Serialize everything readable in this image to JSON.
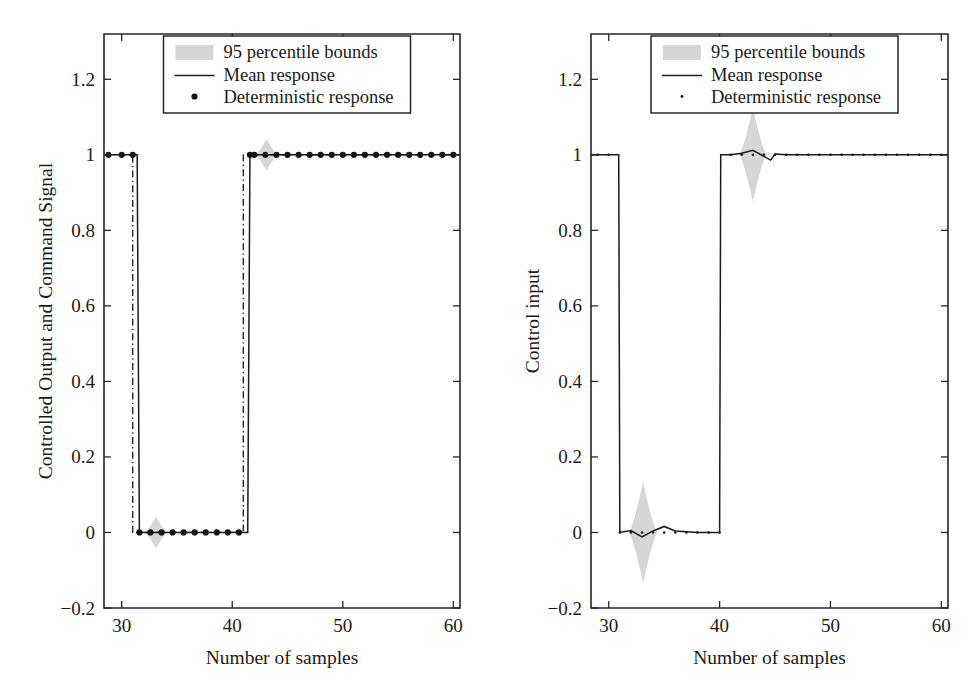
{
  "figure": {
    "background": "#ffffff",
    "band_color": "#d6d6d6",
    "line_color": "#1a1a1a",
    "axis_color": "#262626"
  },
  "chart_data": [
    {
      "id": "left",
      "type": "line",
      "title": "",
      "xlabel": "Number of samples",
      "ylabel": "Controlled Output and Command Signal",
      "xlim": [
        28.4,
        60.6
      ],
      "ylim": [
        -0.2,
        1.32
      ],
      "xticks": [
        30,
        40,
        50,
        60
      ],
      "xtick_labels": [
        "30",
        "40",
        "50",
        "60"
      ],
      "yticks": [
        -0.2,
        0,
        0.2,
        0.4,
        0.6,
        0.8,
        1,
        1.2
      ],
      "ytick_labels": [
        "-0.2",
        "0",
        "0.2",
        "0.4",
        "0.6",
        "0.8",
        "1",
        "1.2"
      ],
      "grid": false,
      "legend_position": "top-center",
      "legend": [
        {
          "marker": "patch",
          "label": "95 percentile bounds"
        },
        {
          "marker": "line",
          "label": "Mean response"
        },
        {
          "marker": "dot",
          "label": "Deterministic response"
        }
      ],
      "series": [
        {
          "name": "Command signal",
          "style": "dash-dot",
          "x": [
            28.4,
            31.0,
            31.0,
            41.0,
            41.0,
            60.6
          ],
          "values": [
            1,
            1,
            0,
            0,
            1,
            1
          ]
        },
        {
          "name": "Mean response",
          "style": "solid",
          "x": [
            28.4,
            31.4,
            31.6,
            41.4,
            41.6,
            60.6
          ],
          "values": [
            1,
            1,
            0,
            0,
            1,
            1
          ]
        },
        {
          "name": "Deterministic response",
          "style": "dots",
          "x": [
            28.8,
            30.0,
            31.0,
            31.6,
            32.6,
            33.6,
            34.6,
            35.6,
            36.6,
            37.6,
            38.6,
            39.6,
            40.6,
            41.6,
            42.0,
            43.0,
            44.0,
            45.0,
            46.0,
            47.0,
            48.0,
            49.0,
            50.0,
            51.0,
            52.0,
            53.0,
            54.0,
            55.0,
            56.0,
            57.0,
            58.0,
            59.0,
            60.0
          ],
          "values": [
            1,
            1,
            1,
            0,
            0,
            0,
            0,
            0,
            0,
            0,
            0,
            0,
            0,
            1,
            1,
            1,
            1,
            1,
            1,
            1,
            1,
            1,
            1,
            1,
            1,
            1,
            1,
            1,
            1,
            1,
            1,
            1,
            1
          ]
        }
      ],
      "bands": [
        {
          "name": "lower band",
          "center_x": 33.1,
          "center_y": 0.0,
          "half_width_x": 1.05,
          "half_height_y": 0.042
        },
        {
          "name": "upper band",
          "center_x": 43.1,
          "center_y": 1.0,
          "half_width_x": 1.05,
          "half_height_y": 0.042
        }
      ]
    },
    {
      "id": "right",
      "type": "line",
      "title": "",
      "xlabel": "Number of samples",
      "ylabel": "Control input",
      "xlim": [
        28.4,
        60.6
      ],
      "ylim": [
        -0.2,
        1.32
      ],
      "xticks": [
        30,
        40,
        50,
        60
      ],
      "xtick_labels": [
        "30",
        "40",
        "50",
        "60"
      ],
      "yticks": [
        -0.2,
        0,
        0.2,
        0.4,
        0.6,
        0.8,
        1,
        1.2
      ],
      "ytick_labels": [
        "-0.2",
        "0",
        "0.2",
        "0.4",
        "0.6",
        "0.8",
        "1",
        "1.2"
      ],
      "grid": false,
      "legend_position": "top-center",
      "legend": [
        {
          "marker": "patch",
          "label": "95 percentile bounds"
        },
        {
          "marker": "line",
          "label": "Mean response"
        },
        {
          "marker": "dot",
          "label": "Deterministic response"
        }
      ],
      "series": [
        {
          "name": "Mean response",
          "style": "solid",
          "x": [
            28.4,
            30.9,
            31.0,
            32.0,
            33.0,
            34.0,
            35.0,
            36.0,
            37.0,
            38.0,
            39.0,
            40.0,
            40.1,
            41.0,
            42.0,
            43.0,
            44.0,
            44.6,
            45.0,
            46.0,
            48.0,
            50.0,
            55.0,
            60.6
          ],
          "values": [
            1,
            1,
            0,
            0.005,
            -0.012,
            0.004,
            0.016,
            0.004,
            0.002,
            0.0,
            0.0,
            0.0,
            1,
            1.0,
            1.004,
            1.012,
            0.996,
            0.986,
            1.002,
            1.0,
            1.0,
            1.0,
            1.0,
            1.0
          ]
        },
        {
          "name": "Deterministic response",
          "style": "dots-small",
          "x": [
            29.0,
            30.0,
            31.0,
            32.0,
            33.0,
            34.0,
            35.0,
            36.0,
            37.0,
            38.0,
            39.0,
            40.0,
            41.0,
            42.0,
            43.0,
            44.0,
            45.0,
            46.0,
            47.0,
            48.0,
            49.0,
            50.0,
            51.0,
            52.0,
            53.0,
            54.0,
            55.0,
            56.0,
            57.0,
            58.0,
            59.0,
            60.0
          ],
          "values": [
            1,
            1,
            0,
            0,
            0,
            0,
            0,
            0,
            0,
            0,
            0,
            0,
            1,
            1,
            1,
            1,
            1,
            1,
            1,
            1,
            1,
            1,
            1,
            1,
            1,
            1,
            1,
            1,
            1,
            1,
            1,
            1
          ]
        }
      ],
      "bands": [
        {
          "name": "lower band",
          "center_x": 33.1,
          "center_y": 0.0,
          "half_width_x": 1.3,
          "half_height_y": 0.135
        },
        {
          "name": "upper band",
          "center_x": 43.0,
          "center_y": 1.0,
          "half_width_x": 1.25,
          "half_height_y": 0.125
        }
      ]
    }
  ]
}
